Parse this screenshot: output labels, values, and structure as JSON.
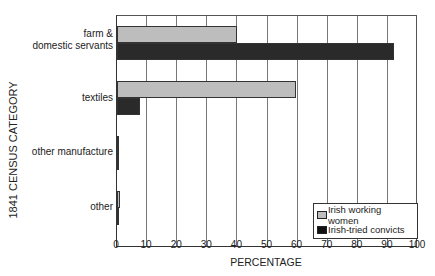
{
  "chart_data": {
    "type": "bar",
    "orientation": "horizontal",
    "title": "",
    "xlabel": "PERCENTAGE",
    "ylabel": "1841 CENSUS CATEGORY",
    "xlim": [
      0,
      100
    ],
    "xticks": [
      "0",
      "10",
      "20",
      "30",
      "40",
      "50",
      "60",
      "70",
      "80",
      "90",
      "100"
    ],
    "grid": "vertical",
    "legend_position": "lower right",
    "categories": [
      "farm & domestic servants",
      "textiles",
      "other manufacture",
      "other"
    ],
    "series": [
      {
        "name": "Irish working women",
        "color": "#bdbdbd",
        "values": [
          40,
          59.5,
          0.3,
          1
        ]
      },
      {
        "name": "Irish-tried convicts",
        "color": "#2a2a2a",
        "values": [
          92,
          7.5,
          0.3,
          0.7
        ]
      }
    ]
  },
  "labels": {
    "ylabel": "1841 CENSUS CATEGORY",
    "xlabel": "PERCENTAGE",
    "cat0_line1": "farm &",
    "cat0_line2": "domestic servants",
    "cat1": "textiles",
    "cat2": "other manufacture",
    "cat3": "other",
    "legend0": "Irish working women",
    "legend1": "Irish-tried convicts"
  }
}
